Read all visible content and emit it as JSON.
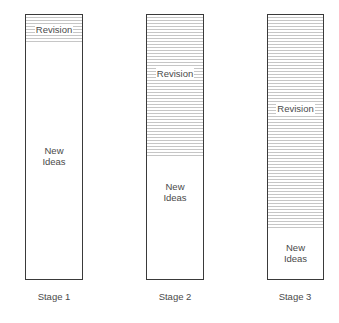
{
  "diagram": {
    "bars": [
      {
        "stage": "Stage 1",
        "revision_label": "Revision",
        "new_ideas_label": [
          "New",
          "Ideas"
        ],
        "revision_fraction": 0.11
      },
      {
        "stage": "Stage 2",
        "revision_label": "Revision",
        "new_ideas_label": [
          "New",
          "Ideas"
        ],
        "revision_fraction": 0.53
      },
      {
        "stage": "Stage 3",
        "revision_label": "Revision",
        "new_ideas_label": [
          "New",
          "Ideas"
        ],
        "revision_fraction": 0.81
      }
    ]
  }
}
